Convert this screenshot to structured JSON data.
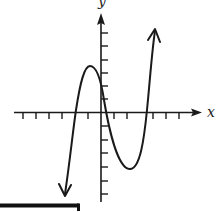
{
  "diagram": {
    "type": "function-graph",
    "axes": {
      "x_label": "x",
      "y_label": "y",
      "x_ticks_left": 6,
      "x_ticks_right": 6,
      "y_ticks_up": 6,
      "y_ticks_down": 6
    },
    "curve": {
      "shape": "cubic",
      "end_behavior": "down-left, up-right",
      "x_intercepts_approx_units": [
        -2,
        0.2,
        3.3
      ],
      "local_max_approx_units": [
        -0.8,
        3.5
      ],
      "local_min_approx_units": [
        2.2,
        -4.3
      ]
    },
    "colors": {
      "stroke": "#1a1a1a",
      "background": "#ffffff"
    }
  }
}
